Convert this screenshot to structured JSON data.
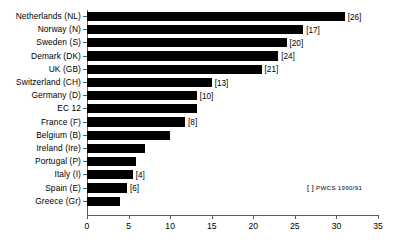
{
  "chart_data": {
    "type": "bar",
    "orientation": "horizontal",
    "title": "",
    "subtitle": "",
    "xlabel": "",
    "ylabel": "",
    "xlim": [
      0,
      35
    ],
    "xticks": [
      0,
      5,
      10,
      15,
      20,
      25,
      30,
      35
    ],
    "xtick_labels": [
      "0",
      "5",
      "10",
      "15",
      "20",
      "25",
      "30",
      "35"
    ],
    "grid": false,
    "legend_position": "bottom-right",
    "categories": [
      "Netherlands (NL)",
      "Norway (N)",
      "Sweden (S)",
      "Demark (DK)",
      "UK (GB)",
      "Switzerland (CH)",
      "Germany (D)",
      "EC 12",
      "France (F)",
      "Belgium (B)",
      "Ireland (Ire)",
      "Portugal (P)",
      "Italy (I)",
      "Spain (E)",
      "Greece (Gr)"
    ],
    "values": [
      31.0,
      26.0,
      24.0,
      23.0,
      21.0,
      15.0,
      13.2,
      13.2,
      11.8,
      10.0,
      7.0,
      5.9,
      5.5,
      4.8,
      4.0
    ],
    "bracket_labels": [
      "[26]",
      "[17]",
      "[20]",
      "[24]",
      "[21]",
      "[13]",
      "[10]",
      "",
      "[8]",
      "",
      "",
      "",
      "[4]",
      "[6]",
      ""
    ],
    "bracket_values": [
      26,
      17,
      20,
      24,
      21,
      13,
      10,
      null,
      8,
      null,
      null,
      null,
      4,
      6,
      null
    ],
    "series_color": "#000000",
    "axis_color": "#5a5a5a",
    "background": "#ffffff"
  },
  "legend": {
    "bracket_symbol": "[  ]",
    "text": "PWCS 1990/91"
  }
}
